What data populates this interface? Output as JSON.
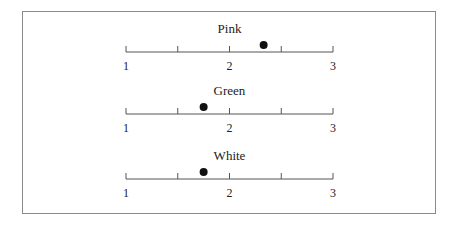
{
  "chart_data": {
    "type": "scatter",
    "title": "",
    "xlabel": "",
    "ylabel": "",
    "xlim": [
      1,
      3
    ],
    "ticks": [
      1,
      1.5,
      2,
      2.5,
      3
    ],
    "tick_labels": [
      "1",
      "2",
      "3"
    ],
    "panels": [
      {
        "name": "Pink",
        "value": 2.33
      },
      {
        "name": "Green",
        "value": 1.75
      },
      {
        "name": "White",
        "value": 1.75
      }
    ],
    "grid": false,
    "legend": "none"
  },
  "colors": {
    "axis": "#555555",
    "dot": "#111111",
    "border": "#8a8a8a",
    "text": "#222222"
  }
}
